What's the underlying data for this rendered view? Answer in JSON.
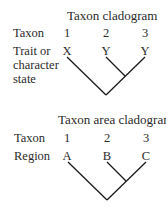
{
  "top": {
    "title": "Taxon cladogram",
    "row1_label": "Taxon",
    "row2_label_lines": [
      "Trait or",
      "character",
      "state"
    ],
    "taxa": [
      "1",
      "2",
      "3"
    ],
    "states": [
      "X",
      "Y",
      "Y"
    ]
  },
  "bottom": {
    "title": "Taxon area cladogram",
    "row1_label": "Taxon",
    "row2_label": "Region",
    "taxa": [
      "1",
      "2",
      "3"
    ],
    "regions": [
      "A",
      "B",
      "C"
    ]
  },
  "colors": {
    "line": "#1a1a1a",
    "text": "#2a2a2a"
  }
}
